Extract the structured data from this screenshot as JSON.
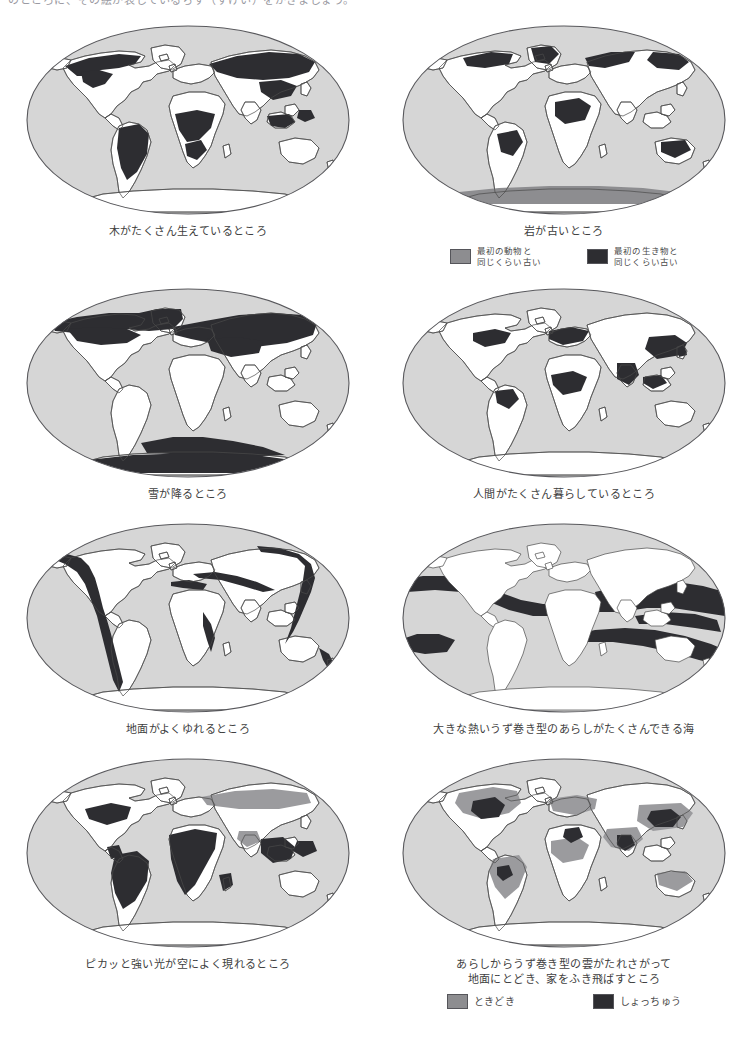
{
  "page": {
    "top_clipped_line": "のところに、その絵が表しているちず（ずけい）をかきましょう。",
    "colors": {
      "ocean": "#d6d6d6",
      "land": "#ffffff",
      "highlight_dark": "#2d2d31",
      "highlight_mid": "#8d8d90",
      "outline": "#4a4a4a",
      "text": "#404040"
    }
  },
  "panels": [
    {
      "id": "forests",
      "caption": "木がたくさん生えているところ",
      "map_name": "world-map-forests",
      "legend": []
    },
    {
      "id": "old-rock",
      "caption": "岩が古いところ",
      "map_name": "world-map-old-rock",
      "legend": [
        {
          "swatch": "mid",
          "label": "最初の動物と\n同じくらい古い"
        },
        {
          "swatch": "dark",
          "label": "最初の生き物と\n同じくらい古い"
        }
      ]
    },
    {
      "id": "snow",
      "caption": "雪が降るところ",
      "map_name": "world-map-snow",
      "legend": []
    },
    {
      "id": "population",
      "caption": "人間がたくさん暮らしているところ",
      "map_name": "world-map-population",
      "legend": []
    },
    {
      "id": "earthquakes",
      "caption": "地面がよくゆれるところ",
      "map_name": "world-map-earthquakes",
      "legend": []
    },
    {
      "id": "hurricanes",
      "caption": "大きな熱いうず巻き型のあらしがたくさんできる海",
      "map_name": "world-map-hurricanes",
      "legend": []
    },
    {
      "id": "lightning",
      "caption": "ピカッと強い光が空によく現れるところ",
      "map_name": "world-map-lightning",
      "legend": []
    },
    {
      "id": "tornadoes",
      "caption": "あらしからうず巻き型の雲がたれさがって\n地面にとどき、家をふき飛ばすところ",
      "map_name": "world-map-tornadoes",
      "legend": [
        {
          "swatch": "mid",
          "label": "ときどき"
        },
        {
          "swatch": "dark",
          "label": "しょっちゅう"
        }
      ]
    }
  ]
}
